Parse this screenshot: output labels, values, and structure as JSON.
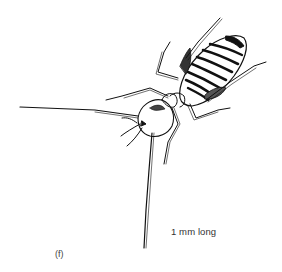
{
  "figure": {
    "panel_label": "(f)",
    "scale_annotation": "1 mm long",
    "colors": {
      "background": "#ffffff",
      "ink": "#111111",
      "label_text": "#333333"
    }
  }
}
